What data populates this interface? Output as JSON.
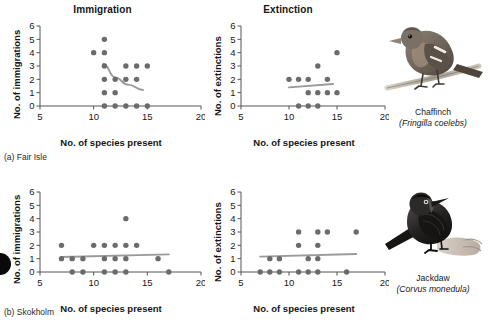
{
  "figure": {
    "column_titles": [
      "Immigration",
      "Extinction"
    ],
    "x_axis_label": "No. of species present",
    "y_axis_labels": [
      "No. of immigrations",
      "No. of extinctions"
    ],
    "panel_captions": [
      "(a) Fair Isle",
      "(b) Skokholm"
    ],
    "x_ticks": [
      "5",
      "10",
      "15",
      "20"
    ],
    "y_ticks": [
      "0",
      "1",
      "2",
      "3",
      "4",
      "5",
      "6"
    ],
    "point_color": "#6b6b6b",
    "trend_color": "#9a9a9a",
    "axis_color": "#555555"
  },
  "birds": [
    {
      "common_name": "Chaffinch",
      "scientific_name": "(Fringilla coelebs)",
      "icon": "chaffinch-illustration"
    },
    {
      "common_name": "Jackdaw",
      "scientific_name": "(Corvus monedula)",
      "icon": "jackdaw-illustration"
    }
  ],
  "chart_data": [
    {
      "id": "fair-isle-immigration",
      "type": "scatter",
      "title": "Immigration",
      "panel": "(a) Fair Isle",
      "xlabel": "No. of species present",
      "ylabel": "No. of immigrations",
      "xlim": [
        5,
        20
      ],
      "ylim": [
        0,
        6
      ],
      "xticks": [
        5,
        10,
        15,
        20
      ],
      "yticks": [
        0,
        1,
        2,
        3,
        4,
        5,
        6
      ],
      "grid": false,
      "legend": "none",
      "points": [
        {
          "x": 11,
          "y": 5
        },
        {
          "x": 10,
          "y": 4
        },
        {
          "x": 11,
          "y": 4
        },
        {
          "x": 11,
          "y": 3
        },
        {
          "x": 13,
          "y": 3
        },
        {
          "x": 14,
          "y": 3
        },
        {
          "x": 15,
          "y": 3
        },
        {
          "x": 11,
          "y": 2
        },
        {
          "x": 12,
          "y": 2
        },
        {
          "x": 13,
          "y": 2
        },
        {
          "x": 14,
          "y": 2
        },
        {
          "x": 11,
          "y": 1
        },
        {
          "x": 12,
          "y": 1
        },
        {
          "x": 11,
          "y": 0
        },
        {
          "x": 12,
          "y": 0
        },
        {
          "x": 13,
          "y": 0
        },
        {
          "x": 14,
          "y": 0
        },
        {
          "x": 15,
          "y": 0
        }
      ],
      "trend": {
        "kind": "curve",
        "direction": "decreasing",
        "path": [
          [
            10.9,
            3.15
          ],
          [
            12.0,
            2.15
          ],
          [
            13.2,
            1.6
          ],
          [
            14.6,
            1.2
          ]
        ]
      }
    },
    {
      "id": "fair-isle-extinction",
      "type": "scatter",
      "title": "Extinction",
      "panel": "(a) Fair Isle",
      "xlabel": "No. of species present",
      "ylabel": "No. of extinctions",
      "xlim": [
        5,
        20
      ],
      "ylim": [
        0,
        6
      ],
      "xticks": [
        5,
        10,
        15,
        20
      ],
      "yticks": [
        0,
        1,
        2,
        3,
        4,
        5,
        6
      ],
      "grid": false,
      "legend": "none",
      "points": [
        {
          "x": 15,
          "y": 4
        },
        {
          "x": 13,
          "y": 3
        },
        {
          "x": 10,
          "y": 2
        },
        {
          "x": 11,
          "y": 2
        },
        {
          "x": 12,
          "y": 2
        },
        {
          "x": 14,
          "y": 2
        },
        {
          "x": 12,
          "y": 1
        },
        {
          "x": 13,
          "y": 1
        },
        {
          "x": 14,
          "y": 1
        },
        {
          "x": 15,
          "y": 1
        },
        {
          "x": 11,
          "y": 0
        },
        {
          "x": 12,
          "y": 0
        },
        {
          "x": 13,
          "y": 0
        }
      ],
      "trend": {
        "kind": "line",
        "direction": "increasing",
        "path": [
          [
            10.0,
            1.4
          ],
          [
            14.6,
            1.65
          ]
        ]
      }
    },
    {
      "id": "skokholm-immigration",
      "type": "scatter",
      "title": "Immigration",
      "panel": "(b) Skokholm",
      "xlabel": "No. of species present",
      "ylabel": "No. of immigrations",
      "xlim": [
        5,
        20
      ],
      "ylim": [
        0,
        6
      ],
      "xticks": [
        5,
        10,
        15,
        20
      ],
      "yticks": [
        0,
        1,
        2,
        3,
        4,
        5,
        6
      ],
      "grid": false,
      "legend": "none",
      "points": [
        {
          "x": 13,
          "y": 4
        },
        {
          "x": 7,
          "y": 2
        },
        {
          "x": 10,
          "y": 2
        },
        {
          "x": 11,
          "y": 2
        },
        {
          "x": 12,
          "y": 2
        },
        {
          "x": 13,
          "y": 2
        },
        {
          "x": 14,
          "y": 2
        },
        {
          "x": 7,
          "y": 1
        },
        {
          "x": 8,
          "y": 1
        },
        {
          "x": 9,
          "y": 1
        },
        {
          "x": 11,
          "y": 1
        },
        {
          "x": 12,
          "y": 1
        },
        {
          "x": 13,
          "y": 1
        },
        {
          "x": 16,
          "y": 1
        },
        {
          "x": 8,
          "y": 0
        },
        {
          "x": 9,
          "y": 0
        },
        {
          "x": 11,
          "y": 0
        },
        {
          "x": 12,
          "y": 0
        },
        {
          "x": 13,
          "y": 0
        },
        {
          "x": 17,
          "y": 0
        }
      ],
      "trend": {
        "kind": "line",
        "direction": "flat",
        "path": [
          [
            7.0,
            1.12
          ],
          [
            17.0,
            1.32
          ]
        ]
      }
    },
    {
      "id": "skokholm-extinction",
      "type": "scatter",
      "title": "Extinction",
      "panel": "(b) Skokholm",
      "xlabel": "No. of species present",
      "ylabel": "No. of extinctions",
      "xlim": [
        5,
        20
      ],
      "ylim": [
        0,
        6
      ],
      "xticks": [
        5,
        10,
        15,
        20
      ],
      "yticks": [
        0,
        1,
        2,
        3,
        4,
        5,
        6
      ],
      "grid": false,
      "legend": "none",
      "points": [
        {
          "x": 11,
          "y": 3
        },
        {
          "x": 13,
          "y": 3
        },
        {
          "x": 14,
          "y": 3
        },
        {
          "x": 17,
          "y": 3
        },
        {
          "x": 11,
          "y": 2
        },
        {
          "x": 13,
          "y": 2
        },
        {
          "x": 8,
          "y": 1
        },
        {
          "x": 9,
          "y": 1
        },
        {
          "x": 12,
          "y": 1
        },
        {
          "x": 13,
          "y": 1
        },
        {
          "x": 7,
          "y": 0
        },
        {
          "x": 8,
          "y": 0
        },
        {
          "x": 9,
          "y": 0
        },
        {
          "x": 11,
          "y": 0
        },
        {
          "x": 12,
          "y": 0
        },
        {
          "x": 13,
          "y": 0
        },
        {
          "x": 16,
          "y": 0
        }
      ],
      "trend": {
        "kind": "line",
        "direction": "flat",
        "path": [
          [
            7.0,
            1.15
          ],
          [
            17.0,
            1.35
          ]
        ]
      }
    }
  ]
}
